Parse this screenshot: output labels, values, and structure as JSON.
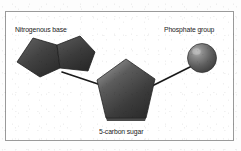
{
  "figure": {
    "background_color": "#ffffff",
    "border_color": "#9a9a9a",
    "labels": {
      "nitrogenous_base": "Nitrogenous base",
      "phosphate_group": "Phosphate group",
      "five_carbon_sugar": "5-carbon sugar"
    },
    "components": [
      {
        "name": "nitrogenous-base",
        "label": "Nitrogenous base",
        "shape": "fused double ring",
        "fill_color": "#3d3d3d"
      },
      {
        "name": "five-carbon-sugar",
        "label": "5-carbon sugar",
        "shape": "pentagon",
        "fill_color": "#4a4a4a"
      },
      {
        "name": "phosphate-group",
        "label": "Phosphate group",
        "shape": "sphere",
        "fill_color": "#5a5a5a"
      }
    ],
    "bonds": [
      {
        "name": "base-to-sugar-bond",
        "from": "nitrogenous-base",
        "to": "five-carbon-sugar",
        "color": "#1a1a1a"
      },
      {
        "name": "sugar-to-phosphate-bond",
        "from": "five-carbon-sugar",
        "to": "phosphate-group",
        "color": "#1a1a1a"
      }
    ]
  }
}
